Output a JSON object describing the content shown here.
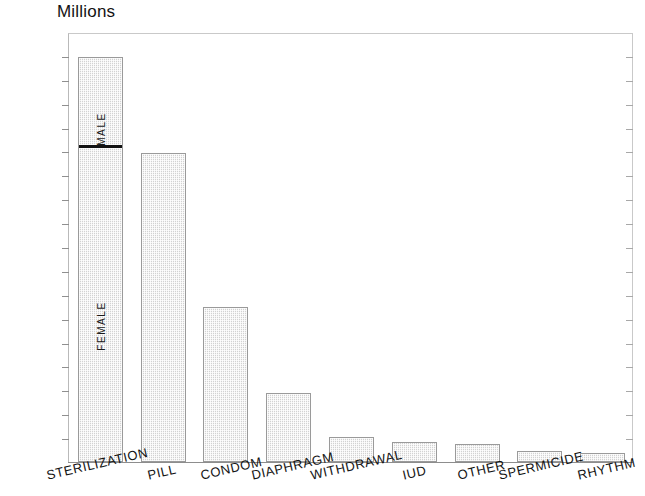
{
  "chart_data": {
    "type": "bar",
    "title": "Millions",
    "xlabel": "",
    "ylabel": "Millions",
    "ylim": [
      0,
      14.4
    ],
    "grid": false,
    "legend": "none",
    "y_ticks": [
      "0",
      "0.8",
      "1.6",
      "2.4",
      "3.2",
      "4",
      "4.8",
      "5.6",
      "6.4",
      "7.2",
      "8",
      "8.8",
      "9.6",
      "10.4",
      "11.2",
      "12",
      "12.8",
      "13.6",
      "14.4"
    ],
    "y_tick_values": [
      0,
      0.8,
      1.6,
      2.4,
      3.2,
      4,
      4.8,
      5.6,
      6.4,
      7.2,
      8,
      8.8,
      9.6,
      10.4,
      11.2,
      12,
      12.8,
      13.6,
      14.4
    ],
    "categories": [
      "STERILIZATION",
      "PILL",
      "CONDOM",
      "DIAPHRAGM",
      "WITHDRAWAL",
      "IUD",
      "OTHER",
      "SPERMICIDE",
      "RHYTHM"
    ],
    "values": [
      13.55,
      10.35,
      5.2,
      2.3,
      0.83,
      0.68,
      0.62,
      0.38,
      0.3
    ],
    "stacked_first_bar": {
      "category": "STERILIZATION",
      "total": 13.55,
      "segments": [
        {
          "name": "FEMALE",
          "value": 10.5,
          "label": "FEMALE"
        },
        {
          "name": "MALE",
          "value": 3.05,
          "label": "MALE"
        }
      ],
      "divider_value": 10.5
    },
    "annotations": [
      {
        "text": "MALE",
        "orientation": "vertical"
      },
      {
        "text": "FEMALE",
        "orientation": "vertical"
      }
    ]
  },
  "colors": {
    "bar_fill": "#d2d2d2",
    "bar_border": "#9a9a9a",
    "axis": "#8f8f8f",
    "text": "#131313",
    "divider": "#121212",
    "background": "#ffffff"
  }
}
